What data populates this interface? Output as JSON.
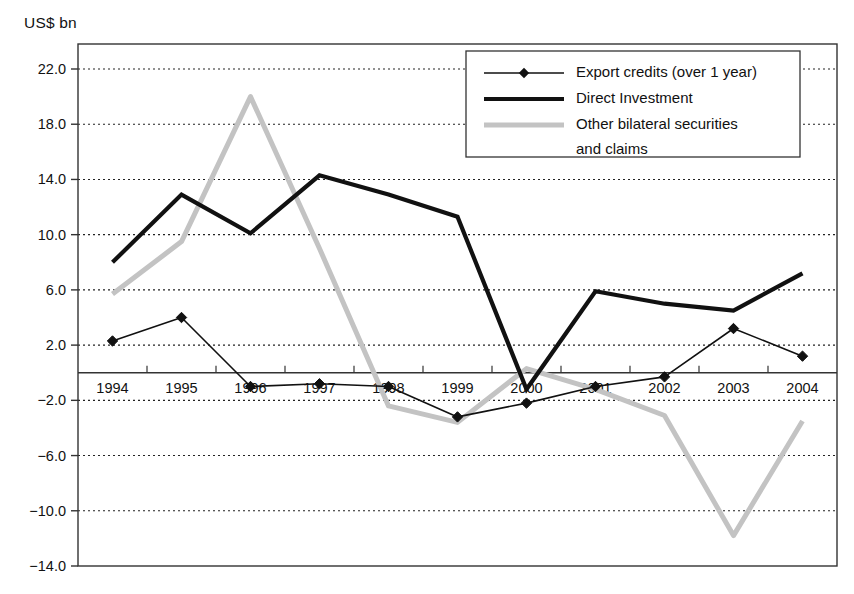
{
  "chart_data": {
    "type": "line",
    "title": "",
    "subtitle": "",
    "unit_label": "US$ bn",
    "xlabel": "",
    "ylabel": "",
    "categories": [
      "1994",
      "1995",
      "1996",
      "1997",
      "1998",
      "1999",
      "2000",
      "2001",
      "2002",
      "2003",
      "2004"
    ],
    "ylim": [
      -14.0,
      22.0
    ],
    "yticks": [
      "22.0",
      "18.0",
      "14.0",
      "10.0",
      "6.0",
      "2.0",
      "-2.0",
      "-6.0",
      "-10.0",
      "-14.0"
    ],
    "ytick_values": [
      22.0,
      18.0,
      14.0,
      10.0,
      6.0,
      2.0,
      -2.0,
      -6.0,
      -10.0,
      -14.0
    ],
    "grid": true,
    "zero_line": 0,
    "legend_position": "top-right",
    "series": [
      {
        "name": "Export credits (over 1 year)",
        "style": "thin-line-with-diamond-markers",
        "color": "#111111",
        "marker": "diamond",
        "values": [
          2.3,
          4.0,
          -1.0,
          -0.8,
          -1.0,
          -3.2,
          -2.2,
          -1.0,
          -0.3,
          3.2,
          1.2
        ]
      },
      {
        "name": "Direct Investment",
        "style": "thick-line",
        "color": "#111111",
        "marker": "none",
        "values": [
          8.0,
          12.9,
          10.1,
          14.3,
          12.9,
          11.3,
          -1.2,
          5.9,
          5.0,
          4.5,
          7.2
        ]
      },
      {
        "name": "Other bilateral securities and claims",
        "style": "thick-light-gray-line",
        "color": "#c3c3c3",
        "marker": "none",
        "values": [
          5.7,
          9.5,
          20.0,
          9.0,
          -2.4,
          -3.6,
          0.3,
          -1.2,
          -3.1,
          -11.8,
          -3.5
        ]
      }
    ]
  },
  "legend": {
    "items": [
      {
        "label": "Export credits (over 1 year)"
      },
      {
        "label": "Direct Investment"
      },
      {
        "label": "Other bilateral securities"
      },
      {
        "label": "and claims"
      }
    ]
  }
}
